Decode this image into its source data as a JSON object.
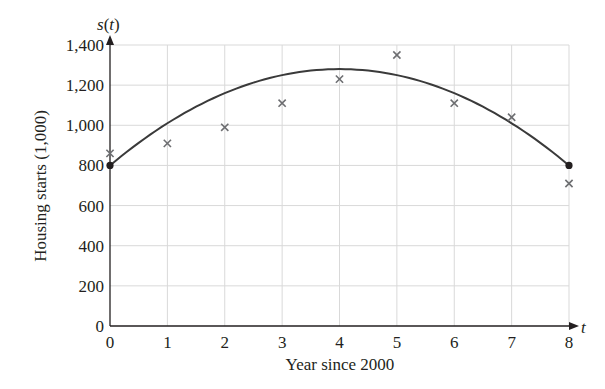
{
  "chart_data": {
    "type": "scatter",
    "title": "",
    "xlabel": "Year since 2000",
    "ylabel": "Housing starts (1,000)",
    "x_axis_var": "t",
    "y_axis_var": "s(t)",
    "xlim": [
      0,
      8
    ],
    "ylim": [
      0,
      1400
    ],
    "x_ticks": [
      0,
      1,
      2,
      3,
      4,
      5,
      6,
      7,
      8
    ],
    "y_ticks": [
      0,
      200,
      400,
      600,
      800,
      1000,
      1200,
      1400
    ],
    "y_tick_labels": [
      "0",
      "200",
      "400",
      "600",
      "800",
      "1,000",
      "1,200",
      "1,400"
    ],
    "grid": true,
    "legend": null,
    "series": [
      {
        "name": "Observed housing starts",
        "type": "scatter",
        "marker": "x",
        "x": [
          0,
          1,
          2,
          3,
          4,
          5,
          6,
          7,
          8
        ],
        "y": [
          860,
          910,
          990,
          1110,
          1230,
          1350,
          1110,
          1040,
          710
        ]
      },
      {
        "name": "Quadratic model s(t)",
        "type": "line",
        "formula": "s(t) = -30t^2 + 240t + 800",
        "coefficients": {
          "a": -30,
          "b": 240,
          "c": 800
        },
        "x": [
          0,
          1,
          2,
          3,
          4,
          5,
          6,
          7,
          8
        ],
        "y": [
          800,
          1010,
          1160,
          1250,
          1280,
          1250,
          1160,
          1010,
          800
        ],
        "endpoints": [
          [
            0,
            800
          ],
          [
            8,
            800
          ]
        ]
      }
    ],
    "colors": {
      "axis": "#231f20",
      "grid": "#d9d9d9",
      "curve": "#3a3a3a",
      "marker": "#6d6e71",
      "endpoint": "#231f20"
    }
  }
}
